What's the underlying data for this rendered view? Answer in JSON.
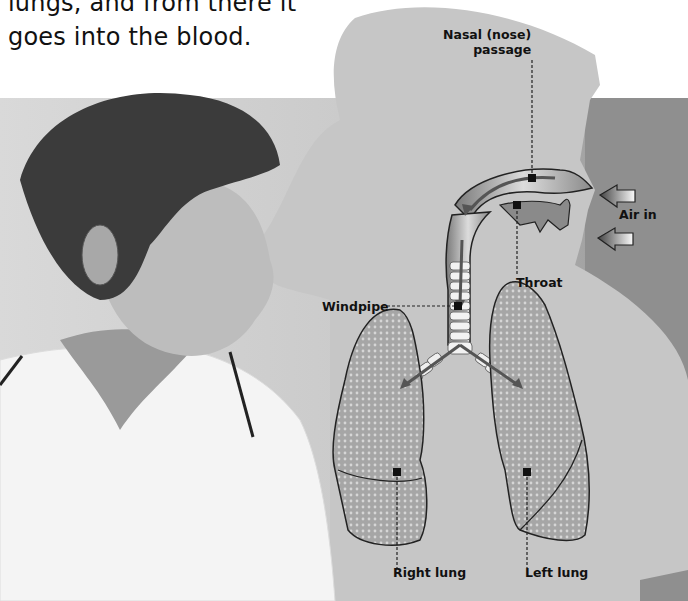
{
  "caption": {
    "line1": "lungs, and from there it",
    "line2": "goes into the blood."
  },
  "diagram": {
    "labels": {
      "nasal": [
        "Nasal (nose)",
        "passage"
      ],
      "air_in": "Air in",
      "throat": "Throat",
      "windpipe": "Windpipe",
      "right_lung": "Right lung",
      "left_lung": "Left lung"
    },
    "colors": {
      "silhouette": "#c4c4c4",
      "dark_panel": "#8f8f8f",
      "lung_fill": "#a8a8a8",
      "text": "#111111"
    }
  },
  "photo": {
    "subject": "boy in white polo shirt looking right"
  }
}
